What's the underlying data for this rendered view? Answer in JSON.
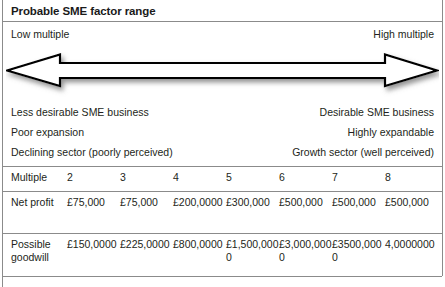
{
  "figure": {
    "header": {
      "title": "Probable SME factor range"
    },
    "scale": {
      "low_label": "Low multiple",
      "high_label": "High multiple"
    },
    "arrow": {
      "name": "double-headed-arrow",
      "direction": "bidirectional",
      "fill": "#ffffff",
      "stroke": "#000000"
    },
    "descriptors": [
      {
        "left": "Less desirable SME business",
        "right": "Desirable SME business"
      },
      {
        "left": "Poor expansion",
        "right": "Highly expandable"
      },
      {
        "left": "Declining sector (poorly perceived)",
        "right": "Growth sector (well perceived)"
      }
    ],
    "table": {
      "rows": [
        {
          "label": "Multiple",
          "values": [
            "2",
            "3",
            "4",
            "5",
            "6",
            "7",
            "8"
          ]
        },
        {
          "label": "Net profit",
          "values": [
            "£75,000",
            "£75,000",
            "£200,0000",
            "£300,000",
            "£500,000",
            "£500,000",
            "£500,000"
          ]
        },
        {
          "label": "Possible goodwill",
          "values": [
            "£150,0000",
            "£225,0000",
            "£800,0000",
            "£1,500,0000",
            "£3,000,0000",
            "£3500,0000",
            "4,0000000"
          ]
        }
      ]
    },
    "colors": {
      "rule": "#8b8b8b",
      "text": "#231f20",
      "background": "#ffffff"
    }
  }
}
